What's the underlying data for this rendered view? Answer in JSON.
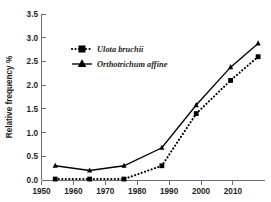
{
  "chart_data": {
    "type": "line",
    "title": "",
    "xlabel": "",
    "ylabel": "Relative frequency %",
    "xlim": [
      1950,
      2015
    ],
    "ylim": [
      0.0,
      3.5
    ],
    "xticks": [
      1950,
      1960,
      1970,
      1980,
      1990,
      2000,
      2010
    ],
    "yticks": [
      "0.0",
      "0.5",
      "1.0",
      "1.5",
      "2.0",
      "2.5",
      "3.0",
      "3.5"
    ],
    "ytick_values": [
      0.0,
      0.5,
      1.0,
      1.5,
      2.0,
      2.5,
      3.0,
      3.5
    ],
    "grid": false,
    "legend_position": "upper-left-inset",
    "x": [
      1954,
      1964,
      1974,
      1985,
      1995,
      2005,
      2013
    ],
    "series": [
      {
        "name": "Ulota bruchii",
        "marker": "square",
        "linestyle": "dotted",
        "color": "#000000",
        "values": [
          0.02,
          0.02,
          0.02,
          0.3,
          1.4,
          2.1,
          2.6
        ]
      },
      {
        "name": "Orthotrichum affine",
        "marker": "triangle",
        "linestyle": "solid",
        "color": "#000000",
        "values": [
          0.3,
          0.2,
          0.3,
          0.68,
          1.58,
          2.38,
          2.88
        ]
      }
    ]
  },
  "legend": {
    "entries": [
      {
        "label": "Ulota bruchii"
      },
      {
        "label": "Orthotrichum affine"
      }
    ]
  },
  "axes": {
    "y_title": "Relative frequency %",
    "y_tick_labels": [
      "3.5",
      "3.0",
      "2.5",
      "2.0",
      "1.5",
      "1.0",
      "0.5",
      "0.0"
    ],
    "x_tick_labels": [
      "1950",
      "1960",
      "1970",
      "1980",
      "1990",
      "2000",
      "2010"
    ]
  },
  "colors": {
    "series": "#000000",
    "axis": "#6d6e71",
    "text": "#231f20",
    "background": "#ffffff"
  }
}
